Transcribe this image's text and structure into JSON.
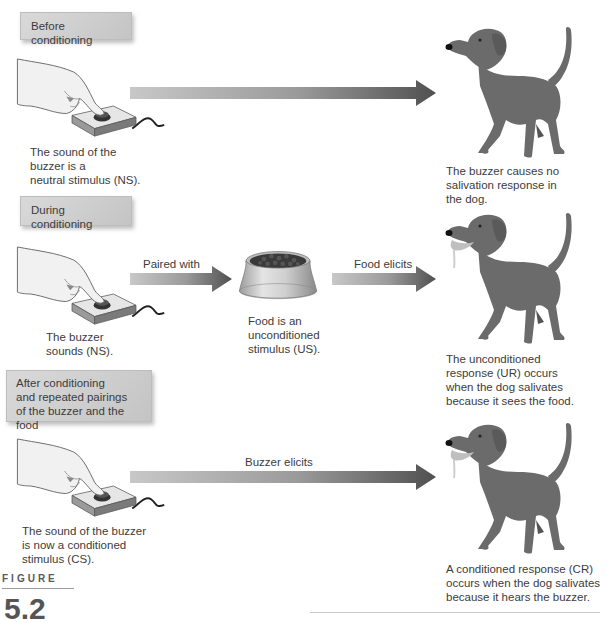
{
  "stages": [
    {
      "label": "Before conditioning",
      "stimulus_caption": [
        "The sound of the",
        "buzzer is a",
        "neutral stimulus (NS)."
      ],
      "arrow_label": "",
      "response_caption": [
        "The buzzer causes no",
        "salivation response in",
        "the dog."
      ]
    },
    {
      "label": "During conditioning",
      "stimulus_caption": [
        "The buzzer",
        "sounds (NS)."
      ],
      "arrow_label": "Paired with",
      "middle_caption": [
        "Food is an",
        "unconditioned",
        "stimulus (US)."
      ],
      "arrow2_label": "Food elicits",
      "response_caption": [
        "The unconditioned",
        "response (UR) occurs",
        "when the dog salivates",
        "because it sees the food."
      ]
    },
    {
      "label_lines": [
        "After conditioning",
        "and repeated pairings",
        "of the buzzer and the food"
      ],
      "stimulus_caption": [
        "The sound of the buzzer",
        "is now a conditioned",
        "stimulus (CS)."
      ],
      "arrow_label": "Buzzer elicits",
      "response_caption": [
        "A conditioned response (CR)",
        "occurs when the dog salivates",
        "because it hears the buzzer."
      ]
    }
  ],
  "figure": {
    "word": "FIGURE",
    "number": "5.2"
  },
  "icons": {
    "hand_buzzer": "hand-pressing-buzzer-icon",
    "dog": "dog-icon",
    "food_bowl": "food-bowl-icon",
    "arrow": "right-arrow-icon"
  },
  "colors": {
    "arrow_light": "#c4c4c4",
    "arrow_dark": "#555555",
    "dog": "#6b6b6b",
    "box": "#d2d2d2"
  }
}
